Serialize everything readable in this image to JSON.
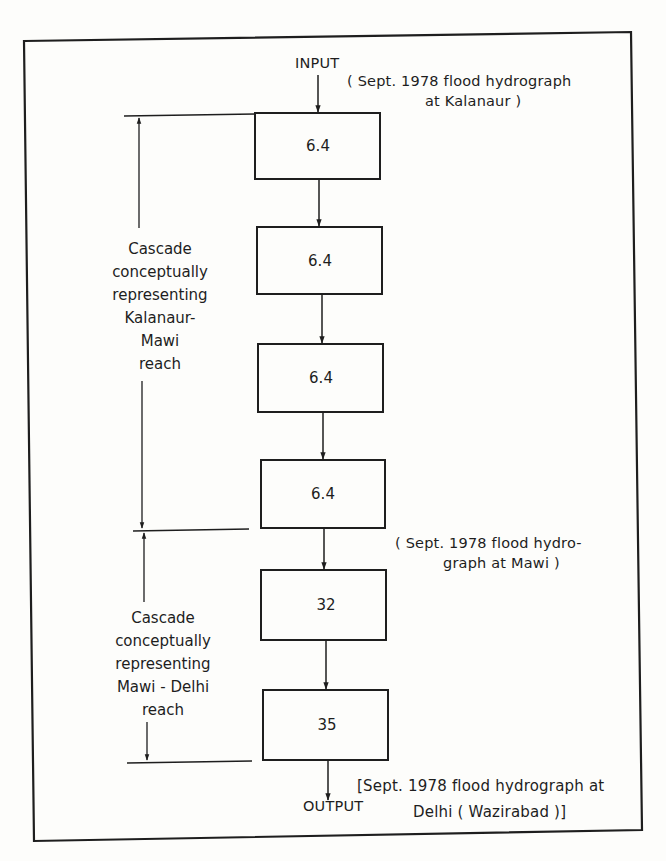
{
  "diagram": {
    "input_label": "INPUT",
    "output_label": "OUTPUT",
    "input_note": {
      "line1": "( Sept. 1978  flood hydrograph",
      "line2": "at  Kalanaur )"
    },
    "mawi_note": {
      "line1": "( Sept. 1978  flood hydro-",
      "line2": "graph at Mawi )"
    },
    "output_note": {
      "line1": "[Sept. 1978  flood hydrograph at",
      "line2": "Delhi ( Wazirabad )]"
    },
    "boxes": [
      {
        "value": "6.4"
      },
      {
        "value": "6.4"
      },
      {
        "value": "6.4"
      },
      {
        "value": "6.4"
      },
      {
        "value": "32"
      },
      {
        "value": "35"
      }
    ],
    "cascades": [
      {
        "lines": [
          "Cascade",
          "conceptually",
          "representing",
          "Kalanaur-",
          "Mawi",
          "reach"
        ]
      },
      {
        "lines": [
          "Cascade",
          "conceptually",
          "representing",
          "Mawi - Delhi",
          "reach"
        ]
      }
    ],
    "colors": {
      "ink": "#1e1e1e",
      "paper": "#fdfdfb"
    }
  }
}
